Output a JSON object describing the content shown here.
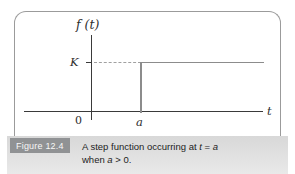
{
  "figure": {
    "label": "Figure 12.4",
    "caption": {
      "l1_pre": "A step function occurring at ",
      "l1_var_t": "t",
      "l1_eq": " = ",
      "l1_var_a": "a",
      "l2_pre": "when ",
      "l2_var_a": "a",
      "l2_post": " > 0."
    }
  },
  "graph": {
    "y_axis_label": "f (t)",
    "k_label": "K",
    "origin_label": "0",
    "a_label": "a",
    "t_axis_label": "t"
  },
  "colors": {
    "axis": "#3a3a3a",
    "step_line": "#8c8c8c",
    "dashed_guide": "#a0a0a0",
    "frame_border": "#9b9b9b",
    "caption_strip": "#dcdcdc",
    "figure_badge_bg": "#909294",
    "figure_badge_text": "#f7f7f7",
    "caption_text": "#1c1c1c"
  },
  "chart_data": {
    "type": "line",
    "title": "",
    "xlabel": "t",
    "ylabel": "f (t)",
    "x_ticks": [
      "0",
      "a"
    ],
    "y_ticks": [
      "K"
    ],
    "grid": false,
    "legend": false,
    "series": [
      {
        "name": "f(t)",
        "description": "Step function: f(t) = 0 for t < a; f(t) = K for t >= a (a > 0)",
        "points": [
          [
            "0",
            "0"
          ],
          [
            "a",
            "0"
          ],
          [
            "a",
            "K"
          ],
          [
            "t_max",
            "K"
          ]
        ]
      }
    ],
    "annotations": [
      "Dashed horizontal guide line at height K from the vertical axis to the step at t = a",
      "Short tick mark on vertical axis at level K"
    ]
  }
}
